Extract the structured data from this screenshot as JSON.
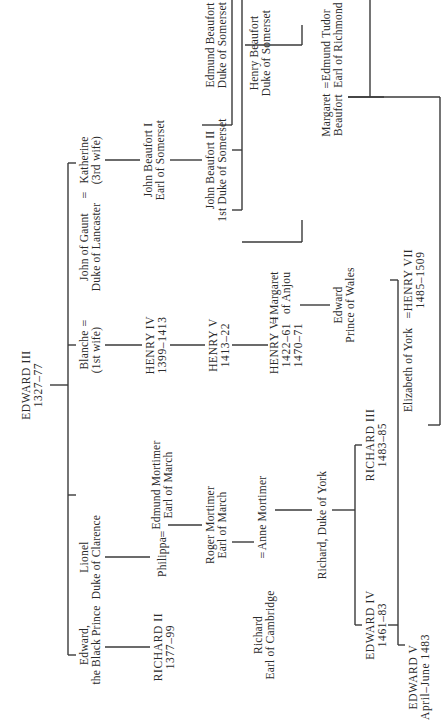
{
  "orientation": "rotated 90 degrees counter-clockwise",
  "colors": {
    "ink": "#2a2a2a",
    "line": "#3a3a3a",
    "background": "#ffffff"
  },
  "people": {
    "edward3": {
      "name": "EDWARD III",
      "dates": "1327–77"
    },
    "black_prince": {
      "name": "Edward,",
      "title": "the Black Prince"
    },
    "lionel": {
      "name": "Lionel",
      "title": "Duke of Clarence"
    },
    "blanche": {
      "name": "Blanche",
      "title": "(1st wife)"
    },
    "gaunt": {
      "name": "John of Gaunt",
      "title": "Duke of Lancaster"
    },
    "katherine": {
      "name": "Katherine",
      "title": "(3rd wife)"
    },
    "richard2": {
      "name": "RICHARD II",
      "dates": "1377–99"
    },
    "philippa": {
      "name": "Philippa"
    },
    "edmund_mortimer": {
      "name": "Edmund Mortimer",
      "title": "Earl of March"
    },
    "roger_mortimer": {
      "name": "Roger Mortimer",
      "title": "Earl of March"
    },
    "henry4": {
      "name": "HENRY IV",
      "dates": "1399–1413"
    },
    "henry5": {
      "name": "HENRY V",
      "dates": "1413–22"
    },
    "henry6": {
      "name": "HENRY VI",
      "dates": "1422–61",
      "dates2": "1470–71"
    },
    "margaret_anjou": {
      "name": "Margaret",
      "title": "of Anjou"
    },
    "edward_pow": {
      "name": "Edward",
      "title": "Prince of Wales"
    },
    "beaufort1": {
      "name": "John Beaufort I",
      "title": "Earl of Somerset"
    },
    "beaufort2": {
      "name": "John Beaufort II",
      "title": "1st Duke of Somerset"
    },
    "edmund_beaufort": {
      "name": "Edmund Beaufort",
      "title": "Duke of Somerset"
    },
    "henry_beaufort": {
      "name": "Henry Beaufort",
      "title": "Duke of Somerset"
    },
    "margaret_beaufort": {
      "name": "Margaret",
      "title": "Beaufort"
    },
    "edmund_tudor": {
      "name": "Edmund Tudor",
      "title": "Earl of Richmond"
    },
    "richard_cambridge": {
      "name": "Richard",
      "title": "Earl of Cambridge"
    },
    "anne_mortimer": {
      "name": "Anne Mortimer"
    },
    "richard_york": {
      "name": "Richard, Duke of York"
    },
    "edward4": {
      "name": "EDWARD IV",
      "dates": "1461–83"
    },
    "richard3": {
      "name": "RICHARD III",
      "dates": "1483–85"
    },
    "edward5": {
      "name": "EDWARD V",
      "dates": "April–June 1483"
    },
    "elizabeth_york": {
      "name": "Elizabeth of York"
    },
    "henry7": {
      "name": "HENRY VII",
      "dates": "1485–1509"
    }
  },
  "marriage_symbol": "="
}
